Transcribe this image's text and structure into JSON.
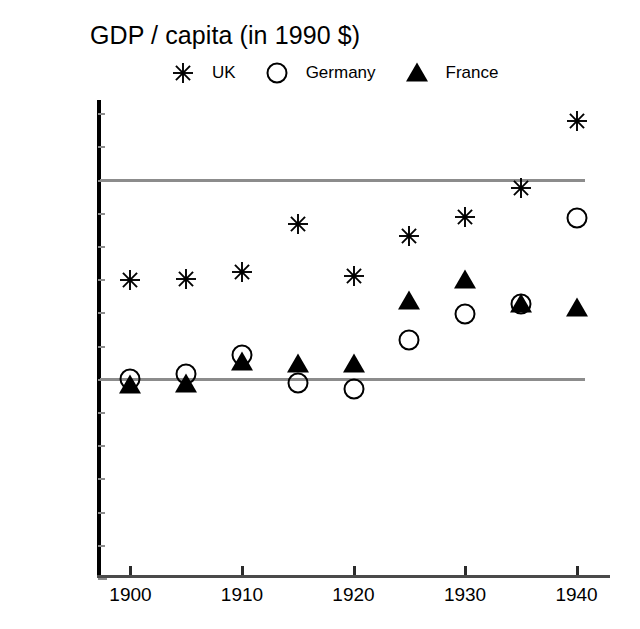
{
  "chart_data": {
    "type": "scatter",
    "title": "GDP / capita (in 1990 $)",
    "xlabel": "",
    "ylabel": "",
    "x": [
      1900,
      1905,
      1910,
      1915,
      1920,
      1925,
      1930,
      1935,
      1940
    ],
    "xlim": [
      1897,
      1943
    ],
    "ylim": [
      0,
      7200
    ],
    "xticks": [
      1900,
      1910,
      1920,
      1930,
      1940
    ],
    "xticklabels": [
      "1900",
      "1910",
      "1920",
      "1930",
      "1940"
    ],
    "yticks": [
      0,
      3000,
      6000
    ],
    "yticklabels": [
      "0",
      "3000",
      "6000"
    ],
    "gridlines": [
      3000,
      6000
    ],
    "grid": true,
    "legend_position": "top",
    "series": [
      {
        "name": "UK",
        "marker": "asterisk",
        "color": "#000000",
        "values": [
          4490,
          4500,
          4610,
          5330,
          4550,
          5150,
          5440,
          5880,
          6880
        ]
      },
      {
        "name": "Germany",
        "marker": "circle",
        "color": "#000000",
        "values": [
          3000,
          3080,
          3360,
          2940,
          2850,
          3580,
          3980,
          4120,
          5430
        ]
      },
      {
        "name": "France",
        "marker": "triangle",
        "color": "#000000",
        "values": [
          2900,
          2920,
          3250,
          3230,
          3220,
          4170,
          4490,
          4130,
          4070
        ]
      }
    ]
  },
  "legend": {
    "items": [
      {
        "label": "UK",
        "marker": "asterisk"
      },
      {
        "label": "Germany",
        "marker": "circle"
      },
      {
        "label": "France",
        "marker": "triangle"
      }
    ]
  }
}
